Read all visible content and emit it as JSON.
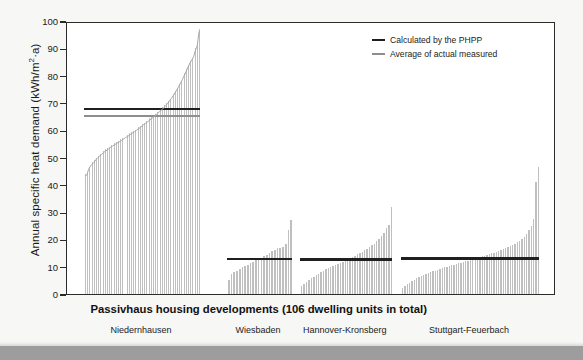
{
  "chart_data": {
    "type": "bar",
    "title": "",
    "xlabel": "",
    "ylabel": "Annual specific heat demand (kWh/m²·a)",
    "ylim": [
      0,
      100
    ],
    "ytick_values": [
      0,
      10,
      20,
      30,
      40,
      50,
      60,
      70,
      80,
      90,
      100
    ],
    "grid": false,
    "legend_position": "top-right",
    "legend": [
      {
        "name": "Calculated by the PHPP",
        "color": "#1f1f1f",
        "style": "thick-line"
      },
      {
        "name": "Average of actual measured",
        "color": "#8e8e8e",
        "style": "thin-line"
      }
    ],
    "bar_color": "#bfbfbf",
    "x_axis_groups": [
      {
        "heading": "Low-energy houses",
        "sites": [
          "Niedernhausen"
        ]
      },
      {
        "heading": "Passivhaus housing developments (106 dwelling units in total)",
        "sites": [
          "Wiesbaden",
          "Hannover-Kronsberg",
          "Stuttgart-Feuerbach"
        ]
      }
    ],
    "series": [
      {
        "name": "Niedernhausen",
        "group": "Low-energy houses",
        "phpp_calculated": 68.5,
        "measured_average": 66.0,
        "values": [
          44.0,
          44.3,
          46.4,
          47.6,
          48.3,
          49.0,
          50.0,
          50.7,
          51.3,
          51.8,
          52.4,
          53.0,
          53.4,
          54.0,
          54.5,
          54.9,
          55.3,
          55.8,
          56.2,
          56.6,
          57.0,
          57.5,
          58.0,
          58.4,
          58.8,
          59.3,
          59.8,
          60.2,
          60.7,
          61.2,
          61.7,
          62.2,
          62.8,
          63.3,
          63.8,
          64.3,
          64.9,
          65.4,
          66.0,
          66.6,
          67.2,
          67.8,
          68.4,
          69.1,
          69.8,
          70.6,
          71.5,
          72.4,
          73.4,
          74.5,
          75.6,
          76.8,
          78.1,
          79.4,
          80.8,
          82.3,
          83.8,
          85.3,
          86.4,
          87.6,
          90.0,
          91.6,
          97.0
        ]
      },
      {
        "name": "Wiesbaden",
        "group": "Passivhaus housing developments",
        "phpp_calculated": 13.5,
        "measured_average": 13.8,
        "values": [
          5.0,
          7.4,
          8.0,
          8.6,
          9.2,
          9.8,
          10.3,
          10.8,
          11.3,
          11.8,
          12.3,
          12.8,
          13.3,
          13.9,
          14.4,
          15.0,
          15.6,
          16.2,
          16.8,
          17.0,
          17.3,
          18.3,
          23.4,
          27.0
        ]
      },
      {
        "name": "Hannover-Kronsberg",
        "group": "Passivhaus housing developments",
        "phpp_calculated": 13.3,
        "measured_average": 13.6,
        "values": [
          3.0,
          3.6,
          4.4,
          5.1,
          5.8,
          6.4,
          7.0,
          7.5,
          8.0,
          8.5,
          9.0,
          9.4,
          9.9,
          10.3,
          10.7,
          11.1,
          11.5,
          11.9,
          12.3,
          12.7,
          13.1,
          13.5,
          14.0,
          14.5,
          15.0,
          15.5,
          16.0,
          16.6,
          17.2,
          17.8,
          18.5,
          19.3,
          20.2,
          21.2,
          22.4,
          24.0,
          25.4,
          32.0
        ]
      },
      {
        "name": "Stuttgart-Feuerbach",
        "group": "Passivhaus housing developments",
        "phpp_calculated": 13.7,
        "measured_average": 13.9,
        "values": [
          2.2,
          3.0,
          3.6,
          4.2,
          4.7,
          5.2,
          5.7,
          6.1,
          6.5,
          6.9,
          7.3,
          7.6,
          8.0,
          8.3,
          8.6,
          8.9,
          9.2,
          9.5,
          9.8,
          10.0,
          10.3,
          10.5,
          10.8,
          11.0,
          11.3,
          11.5,
          11.7,
          12.0,
          12.2,
          12.5,
          12.7,
          13.0,
          13.2,
          13.5,
          13.8,
          14.0,
          14.3,
          14.6,
          14.9,
          15.2,
          15.5,
          15.8,
          16.1,
          16.5,
          16.8,
          17.2,
          17.6,
          18.0,
          18.5,
          19.0,
          19.6,
          20.3,
          21.0,
          22.0,
          23.5,
          25.0,
          27.4,
          41.2,
          46.4
        ]
      }
    ]
  },
  "axis": {
    "y_unit_superscript": "2"
  }
}
